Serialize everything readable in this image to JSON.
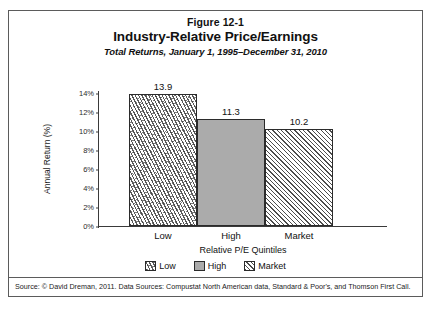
{
  "figure": {
    "label": "Figure 12-1",
    "title": "Industry-Relative Price/Earnings",
    "subtitle": "Total Returns, January 1, 1995–December 31, 2010",
    "source": "Source: © David Dreman, 2011. Data Sources: Compustat North American data, Standard & Poor's, and Thomson First Call."
  },
  "chart_data": {
    "type": "bar",
    "title": "Industry-Relative Price/Earnings",
    "subtitle": "Total Returns, January 1, 1995–December 31, 2010",
    "categories": [
      "Low",
      "High",
      "Market"
    ],
    "values": [
      13.9,
      11.3,
      10.2
    ],
    "value_labels": [
      "13.9",
      "11.3",
      "10.2"
    ],
    "xlabel": "Relative P/E Quintiles",
    "ylabel": "Annual Return (%)",
    "ylim": [
      0,
      14
    ],
    "ytick_values": [
      0,
      2,
      4,
      6,
      8,
      10,
      12,
      14
    ],
    "ytick_labels": [
      "0%",
      "2%",
      "4%",
      "6%",
      "8%",
      "10%",
      "12%",
      "14%"
    ],
    "grid": false,
    "legend_position": "bottom",
    "series": [
      {
        "name": "Low",
        "value": 13.9,
        "pattern": "dash-speckle",
        "color": "#ffffff"
      },
      {
        "name": "High",
        "value": 11.3,
        "pattern": "solid-gray",
        "color": "#ababab"
      },
      {
        "name": "Market",
        "value": 10.2,
        "pattern": "diagonal-hatch",
        "color": "#ffffff"
      }
    ],
    "legend": [
      {
        "label": "Low",
        "pattern": "dash-speckle"
      },
      {
        "label": "High",
        "pattern": "solid-gray"
      },
      {
        "label": "Market",
        "pattern": "diagonal-hatch"
      }
    ]
  },
  "colors": {
    "frame": "#5b5b5b",
    "axis": "#3a3a3a",
    "bar_outline": "#2b2b2b",
    "gray_fill": "#ababab",
    "text": "#111111"
  }
}
